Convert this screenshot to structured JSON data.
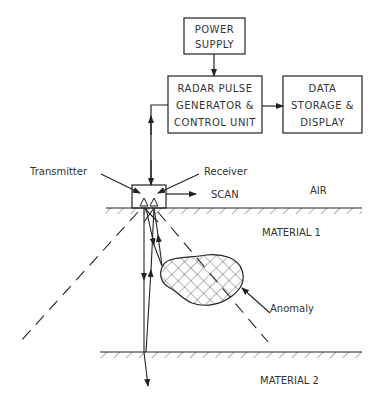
{
  "diagram": {
    "blocks": {
      "power_supply": [
        "POWER",
        "SUPPLY"
      ],
      "radar_unit": [
        "RADAR PULSE",
        "GENERATOR &",
        "CONTROL UNIT"
      ],
      "data_unit": [
        "DATA",
        "STORAGE &",
        "DISPLAY"
      ]
    },
    "labels": {
      "transmitter": "Transmitter",
      "receiver": "Receiver",
      "scan": "SCAN",
      "air": "AIR",
      "material1": "MATERIAL 1",
      "material2": "MATERIAL 2",
      "anomaly": "Anomaly"
    },
    "colors": {
      "line": "#222222",
      "text": "#333333",
      "background": "#ffffff"
    }
  }
}
